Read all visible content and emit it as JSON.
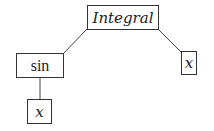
{
  "diagram": {
    "type": "expression-tree",
    "nodes": [
      {
        "id": "root",
        "label": "Integral",
        "style": "italic"
      },
      {
        "id": "sin",
        "label": "sin",
        "style": "roman"
      },
      {
        "id": "x_right",
        "label": "x",
        "style": "italic"
      },
      {
        "id": "x_bottom",
        "label": "x",
        "style": "italic"
      }
    ],
    "edges": [
      {
        "from": "root",
        "to": "sin"
      },
      {
        "from": "root",
        "to": "x_right"
      },
      {
        "from": "sin",
        "to": "x_bottom"
      }
    ]
  }
}
